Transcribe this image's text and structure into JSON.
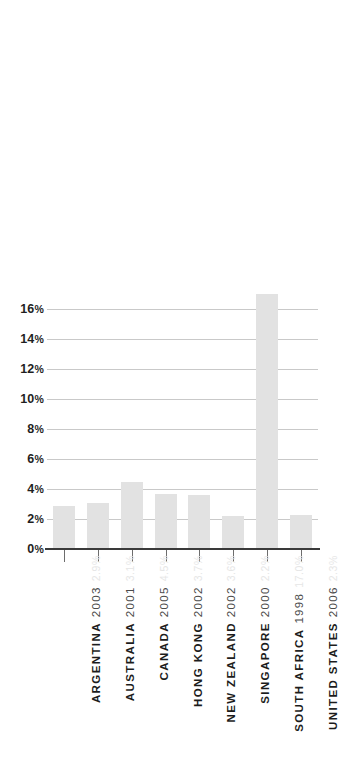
{
  "chart_data": {
    "type": "bar",
    "title": "",
    "subtitle": "",
    "xlabel": "",
    "ylabel": "",
    "ylim": [
      0,
      17.5
    ],
    "grid": true,
    "legend": false,
    "y_tick_labels": [
      "16%",
      "14%",
      "12%",
      "10%",
      "8%",
      "6%",
      "4%",
      "2%",
      "0%"
    ],
    "y_ticks": [
      16,
      14,
      12,
      10,
      8,
      6,
      4,
      2,
      0
    ],
    "categories": [
      "ARGENTINA",
      "AUSTRALIA",
      "CANADA",
      "HONG KONG",
      "NEW ZEALAND",
      "SINGAPORE",
      "SOUTH AFRICA",
      "UNITED STATES"
    ],
    "years": [
      "2003",
      "2001",
      "2005",
      "2002",
      "2002",
      "2000",
      "1998",
      "2006"
    ],
    "values": [
      2.9,
      3.1,
      4.5,
      3.7,
      3.6,
      2.2,
      17.0,
      2.3
    ],
    "value_labels": [
      "2.9%",
      "3.1%",
      "4.5%",
      "3.7%",
      "3.6%",
      "2.2%",
      "17.0%",
      "2.3%"
    ],
    "bar_color": "#e2e2e2",
    "gridline_color": "#c9c9c9",
    "axis_color": "#3a3a3a"
  }
}
